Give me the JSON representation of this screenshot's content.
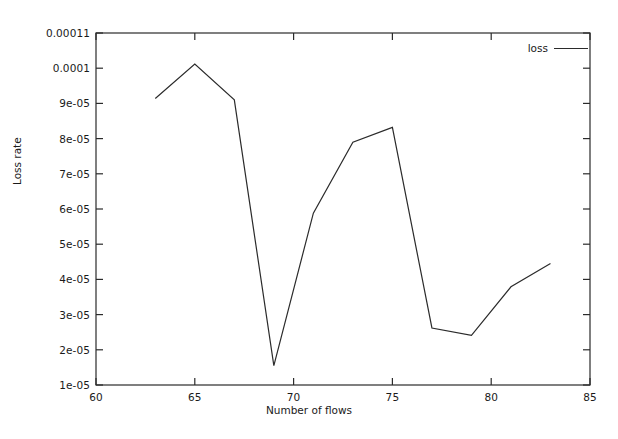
{
  "chart_data": {
    "type": "line",
    "title": "",
    "xlabel": "Number of flows",
    "ylabel": "Loss rate",
    "xlim": [
      60,
      85
    ],
    "ylim": [
      1e-05,
      0.00011
    ],
    "grid": false,
    "legend_position": "top-right",
    "xticks": [
      60,
      65,
      70,
      75,
      80,
      85
    ],
    "xtick_labels": [
      "60",
      "65",
      "70",
      "75",
      "80",
      "85"
    ],
    "yticks": [
      1e-05,
      2e-05,
      3e-05,
      4e-05,
      5e-05,
      6e-05,
      7e-05,
      8e-05,
      9e-05,
      0.0001,
      0.00011
    ],
    "ytick_labels": [
      "1e-05",
      "2e-05",
      "3e-05",
      "4e-05",
      "5e-05",
      "6e-05",
      "7e-05",
      "8e-05",
      "9e-05",
      "0.0001",
      "0.00011"
    ],
    "series": [
      {
        "name": "loss",
        "color": "#2b2b2b",
        "x": [
          63,
          65,
          67,
          69,
          71,
          73,
          75,
          77,
          79,
          81,
          83
        ],
        "values": [
          9.14e-05,
          0.0001012,
          9.1e-05,
          1.55e-05,
          5.88e-05,
          7.9e-05,
          8.32e-05,
          2.62e-05,
          2.41e-05,
          3.79e-05,
          4.45e-05
        ]
      }
    ]
  },
  "legend": {
    "entries": [
      {
        "label": "loss",
        "sample": "line-sample"
      }
    ]
  },
  "axes": {
    "xlabel": "Number of flows",
    "ylabel": "Loss rate"
  }
}
